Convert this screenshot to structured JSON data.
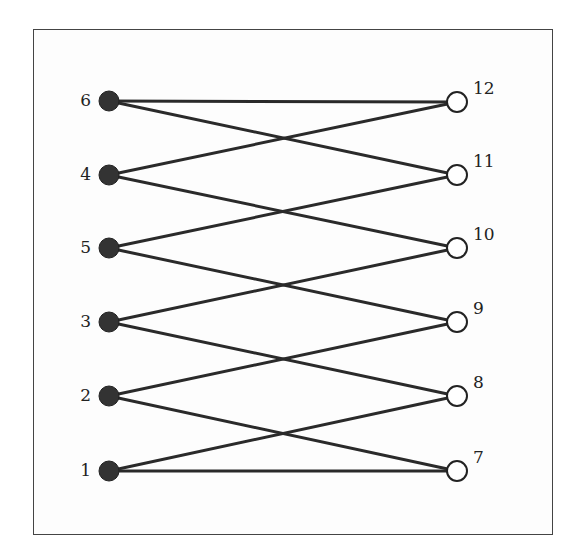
{
  "diagram": {
    "type": "bipartite-graph",
    "frame": {
      "x": 33,
      "y": 29,
      "width": 520,
      "height": 506
    },
    "left_nodes": [
      {
        "id": "6",
        "label": "6",
        "x": 109,
        "y": 101,
        "style": "filled"
      },
      {
        "id": "4",
        "label": "4",
        "x": 109,
        "y": 175,
        "style": "filled"
      },
      {
        "id": "5",
        "label": "5",
        "x": 109,
        "y": 248,
        "style": "filled"
      },
      {
        "id": "3",
        "label": "3",
        "x": 109,
        "y": 322,
        "style": "filled"
      },
      {
        "id": "2",
        "label": "2",
        "x": 109,
        "y": 396,
        "style": "filled"
      },
      {
        "id": "1",
        "label": "1",
        "x": 109,
        "y": 471,
        "style": "filled"
      }
    ],
    "right_nodes": [
      {
        "id": "12",
        "label": "12",
        "x": 457,
        "y": 102,
        "style": "hollow"
      },
      {
        "id": "11",
        "label": "11",
        "x": 457,
        "y": 175,
        "style": "hollow"
      },
      {
        "id": "10",
        "label": "10",
        "x": 457,
        "y": 248,
        "style": "hollow"
      },
      {
        "id": "9",
        "label": "9",
        "x": 457,
        "y": 322,
        "style": "hollow"
      },
      {
        "id": "8",
        "label": "8",
        "x": 457,
        "y": 396,
        "style": "hollow"
      },
      {
        "id": "7",
        "label": "7",
        "x": 457,
        "y": 471,
        "style": "hollow"
      }
    ],
    "edges": [
      [
        "6",
        "12"
      ],
      [
        "6",
        "11"
      ],
      [
        "4",
        "12"
      ],
      [
        "4",
        "10"
      ],
      [
        "5",
        "11"
      ],
      [
        "5",
        "9"
      ],
      [
        "3",
        "10"
      ],
      [
        "3",
        "8"
      ],
      [
        "2",
        "9"
      ],
      [
        "2",
        "7"
      ],
      [
        "1",
        "8"
      ],
      [
        "1",
        "7"
      ]
    ],
    "colors": {
      "edge": "#2a2a2a",
      "filled_node": "#333333",
      "hollow_node": "#ffffff",
      "border": "#444444"
    }
  }
}
